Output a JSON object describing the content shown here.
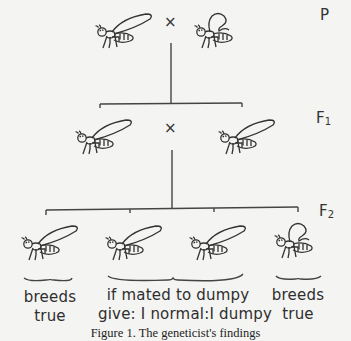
{
  "figure": {
    "caption": "Figure 1. The geneticist's findings"
  },
  "generations": [
    {
      "id": "P",
      "label": "P",
      "sub": ""
    },
    {
      "id": "F1",
      "label": "F",
      "sub": "1"
    },
    {
      "id": "F2",
      "label": "F",
      "sub": "2"
    }
  ],
  "cross_symbol": "×",
  "parents": [
    {
      "phenotype": "normal-wing",
      "icon": "fly-normal-icon"
    },
    {
      "phenotype": "dumpy-wing",
      "icon": "fly-dumpy-icon"
    }
  ],
  "f1": [
    {
      "phenotype": "normal-wing",
      "icon": "fly-normal-icon"
    },
    {
      "phenotype": "normal-wing",
      "icon": "fly-normal-icon"
    }
  ],
  "f2": [
    {
      "phenotype": "normal-wing",
      "icon": "fly-normal-icon"
    },
    {
      "phenotype": "normal-wing",
      "icon": "fly-normal-icon"
    },
    {
      "phenotype": "normal-wing",
      "icon": "fly-normal-icon"
    },
    {
      "phenotype": "dumpy-wing",
      "icon": "fly-dumpy-icon"
    }
  ],
  "annotations": {
    "left": {
      "line1": "breeds",
      "line2": "true"
    },
    "middle": {
      "line1": "if mated to dumpy",
      "line2": "give:  I normal:I dumpy"
    },
    "right": {
      "line1": "breeds",
      "line2": "true"
    }
  }
}
